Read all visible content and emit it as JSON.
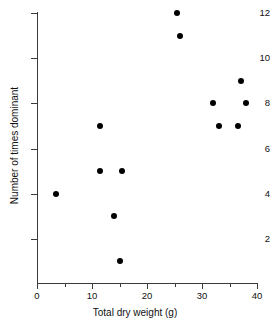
{
  "chart_data": {
    "type": "scatter",
    "title": "",
    "xlabel": "Total dry weight (g)",
    "ylabel": "Number of times dominant",
    "xlim": [
      0,
      40
    ],
    "ylim": [
      0,
      12
    ],
    "xticks": [
      0,
      10,
      20,
      30,
      40
    ],
    "xticklabels": [
      "0",
      "10",
      "20",
      "30",
      "40"
    ],
    "xminorticks": [
      5,
      15,
      25,
      35
    ],
    "yticks": [
      2,
      4,
      6,
      8,
      10,
      12
    ],
    "yticklabels": [
      "2",
      "4",
      "6",
      "8",
      "10",
      "12"
    ],
    "grid": false,
    "legend": null,
    "marker": "filled-circle",
    "marker_color": "#000000",
    "axis_color": "#3b3b3b",
    "points": [
      {
        "x": 3.4,
        "y": 4
      },
      {
        "x": 11.5,
        "y": 7
      },
      {
        "x": 11.5,
        "y": 5
      },
      {
        "x": 14.0,
        "y": 3
      },
      {
        "x": 15.0,
        "y": 1
      },
      {
        "x": 15.5,
        "y": 5
      },
      {
        "x": 25.5,
        "y": 12
      },
      {
        "x": 26.0,
        "y": 11
      },
      {
        "x": 32.0,
        "y": 8
      },
      {
        "x": 33.0,
        "y": 7
      },
      {
        "x": 36.5,
        "y": 7
      },
      {
        "x": 37.0,
        "y": 9
      },
      {
        "x": 38.0,
        "y": 8
      }
    ]
  }
}
